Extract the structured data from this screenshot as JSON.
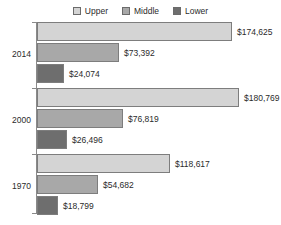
{
  "legend": {
    "position": "top-center",
    "items": [
      {
        "label": "Upper",
        "color": "#d4d4d4",
        "key": "upper"
      },
      {
        "label": "Middle",
        "color": "#a8a8a8",
        "key": "middle"
      },
      {
        "label": "Lower",
        "color": "#6e6e6e",
        "key": "lower"
      }
    ]
  },
  "chart_data": {
    "type": "bar",
    "orientation": "horizontal",
    "title": "",
    "subtitle": "",
    "xlabel": "",
    "ylabel": "",
    "grid": false,
    "legend_position": "top-center",
    "categories": [
      "2014",
      "2000",
      "1970"
    ],
    "value_prefix": "$",
    "xlim": [
      0,
      180769
    ],
    "series": [
      {
        "name": "Upper",
        "color": "#d4d4d4",
        "values": [
          174625,
          180769,
          118617
        ],
        "labels": [
          "$174,625",
          "$180,769",
          "$118,617"
        ]
      },
      {
        "name": "Middle",
        "color": "#a8a8a8",
        "values": [
          73392,
          76819,
          54682
        ],
        "labels": [
          "$73,392",
          "$76,819",
          "$54,682"
        ]
      },
      {
        "name": "Lower",
        "color": "#6e6e6e",
        "values": [
          24074,
          26496,
          18799
        ],
        "labels": [
          "$24,074",
          "$26,496",
          "$18,799"
        ]
      }
    ]
  },
  "axis": {
    "line_color": "#8a8a8a"
  }
}
